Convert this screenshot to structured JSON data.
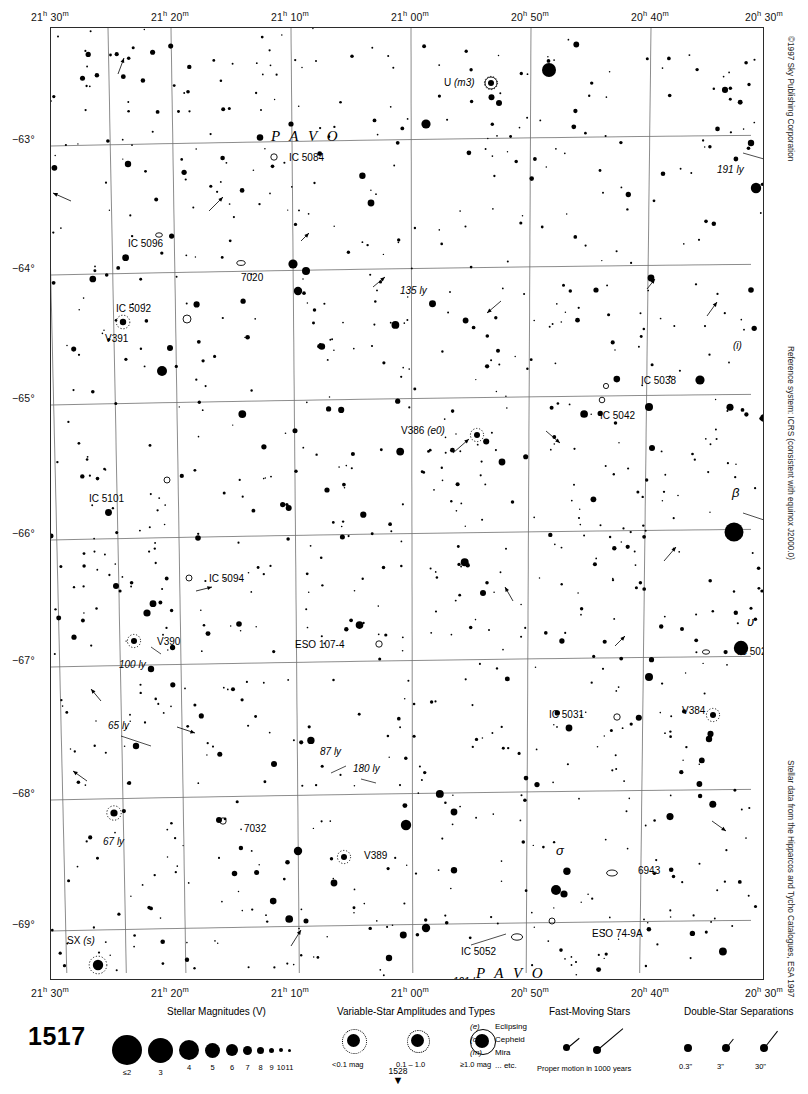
{
  "chart": {
    "number": "1517",
    "next_page": "1528",
    "constellation_labels": [
      "P A V O",
      "P A V O"
    ],
    "copyright": "©1997 Sky Publishing Corporation",
    "reference_note": "Reference system: ICRS (consistent with equinox J2000.0)",
    "data_note": "Stellar data from the Hipparcos and Tycho Catalogues, ESA 1997"
  },
  "chart_data": {
    "type": "scatter",
    "title": "1517",
    "xlabel": "Right Ascension",
    "ylabel": "Declination",
    "xlim": [
      "21h 32m",
      "20h 28m"
    ],
    "ylim": [
      -69.6,
      -62.4
    ],
    "grid": true,
    "ra_ticks": [
      {
        "label_h": "21",
        "label_m": "30",
        "x": 0
      },
      {
        "label_h": "21",
        "label_m": "20",
        "x": 120
      },
      {
        "label_h": "21",
        "label_m": "10",
        "x": 240
      },
      {
        "label_h": "21",
        "label_m": "00",
        "x": 360
      },
      {
        "label_h": "20",
        "label_m": "50",
        "x": 480
      },
      {
        "label_h": "20",
        "label_m": "40",
        "x": 600
      },
      {
        "label_h": "20",
        "label_m": "30",
        "x": 714
      }
    ],
    "dec_ticks": [
      {
        "label": "−63°",
        "y": 112
      },
      {
        "label": "−64°",
        "y": 241
      },
      {
        "label": "−65°",
        "y": 371
      },
      {
        "label": "−66°",
        "y": 506
      },
      {
        "label": "−67°",
        "y": 633
      },
      {
        "label": "−68°",
        "y": 766
      },
      {
        "label": "−69°",
        "y": 897
      }
    ],
    "named_objects": [
      {
        "label": "U (m3)",
        "type": "variable-star",
        "x": 485,
        "y": 82
      },
      {
        "label": "IC 5084",
        "type": "galaxy",
        "x": 281,
        "y": 156
      },
      {
        "label": "191 ly",
        "type": "distance",
        "x": 752,
        "y": 160
      },
      {
        "label": "IC 5096",
        "type": "galaxy",
        "x": 131,
        "y": 236
      },
      {
        "label": "7020",
        "type": "galaxy",
        "x": 252,
        "y": 267
      },
      {
        "label": "135 ly",
        "type": "distance",
        "x": 391,
        "y": 291
      },
      {
        "label": "IC 5092",
        "type": "galaxy",
        "x": 163,
        "y": 313
      },
      {
        "label": "V391",
        "type": "variable-star",
        "x": 114,
        "y": 327
      },
      {
        "label": "(i)",
        "type": "star-letter",
        "x": 726,
        "y": 344
      },
      {
        "label": "IC 5038",
        "type": "galaxy",
        "x": 630,
        "y": 380
      },
      {
        "label": "IC 5042",
        "type": "galaxy",
        "x": 613,
        "y": 403
      },
      {
        "label": "V386 (e0)",
        "type": "variable-star",
        "x": 460,
        "y": 433
      },
      {
        "label": "IC 5101",
        "type": "galaxy",
        "x": 110,
        "y": 487
      },
      {
        "label": "β",
        "type": "bayer-star",
        "x": 733,
        "y": 504
      },
      {
        "label": "138 ly",
        "type": "distance",
        "x": 760,
        "y": 523
      },
      {
        "label": "IC 5094",
        "type": "galaxy",
        "x": 200,
        "y": 577
      },
      {
        "label": "υ",
        "type": "bayer-star",
        "x": 737,
        "y": 620
      },
      {
        "label": "V390",
        "type": "variable-star",
        "x": 148,
        "y": 641
      },
      {
        "label": "100 ly",
        "type": "distance",
        "x": 134,
        "y": 653
      },
      {
        "label": "ESO 107-4",
        "type": "galaxy",
        "x": 350,
        "y": 645
      },
      {
        "label": "IC 5023",
        "type": "galaxy",
        "x": 727,
        "y": 650
      },
      {
        "label": "IC 5031",
        "type": "galaxy",
        "x": 592,
        "y": 713
      },
      {
        "label": "V384",
        "type": "variable-star",
        "x": 707,
        "y": 711
      },
      {
        "label": "65 ly",
        "type": "distance",
        "x": 137,
        "y": 728
      },
      {
        "label": "87 ly",
        "type": "distance",
        "x": 323,
        "y": 758
      },
      {
        "label": "180 ly",
        "type": "distance",
        "x": 358,
        "y": 775
      },
      {
        "label": "67 ly",
        "type": "distance",
        "x": 110,
        "y": 829
      },
      {
        "label": "7032",
        "type": "galaxy",
        "x": 237,
        "y": 823
      },
      {
        "label": "V389",
        "type": "variable-star",
        "x": 355,
        "y": 855
      },
      {
        "label": "σ",
        "type": "bayer-star",
        "x": 557,
        "y": 861
      },
      {
        "label": "6943",
        "type": "galaxy",
        "x": 627,
        "y": 871
      },
      {
        "label": "ESO 74-9A",
        "type": "galaxy",
        "x": 587,
        "y": 924
      },
      {
        "label": "IC 5052",
        "type": "galaxy",
        "x": 490,
        "y": 940
      },
      {
        "label": "SX (s)",
        "type": "variable-star",
        "x": 80,
        "y": 953
      },
      {
        "label": "121 ly",
        "type": "distance",
        "x": 442,
        "y": 980
      }
    ],
    "star_count_approx": 1100
  },
  "legend": {
    "magnitudes": {
      "title": "Stellar Magnitudes (V)",
      "entries": [
        {
          "label": "≤2",
          "size": 30
        },
        {
          "label": "3",
          "size": 25
        },
        {
          "label": "4",
          "size": 20
        },
        {
          "label": "5",
          "size": 15
        },
        {
          "label": "6",
          "size": 12
        },
        {
          "label": "7",
          "size": 9
        },
        {
          "label": "8",
          "size": 7
        },
        {
          "label": "9",
          "size": 5
        },
        {
          "label": "10",
          "size": 4
        },
        {
          "label": "11",
          "size": 3
        }
      ]
    },
    "variables": {
      "title": "Variable-Star Amplitudes and Types",
      "entries": [
        {
          "label": "<0.1 mag"
        },
        {
          "label": "0.1 – 1.0"
        },
        {
          "label": "≥1.0 mag"
        }
      ],
      "types": [
        {
          "code": "(e)",
          "name": "Eclipsing"
        },
        {
          "code": "(c)",
          "name": "Cepheid"
        },
        {
          "code": "(m)",
          "name": "Mira"
        },
        {
          "code": "",
          "name": "... etc."
        }
      ]
    },
    "fast_moving": {
      "title": "Fast-Moving Stars",
      "caption": "Proper motion in 1000 years"
    },
    "doubles": {
      "title": "Double-Star Separations",
      "entries": [
        {
          "label": "0.3\""
        },
        {
          "label": "3\""
        },
        {
          "label": "30\""
        }
      ]
    }
  }
}
